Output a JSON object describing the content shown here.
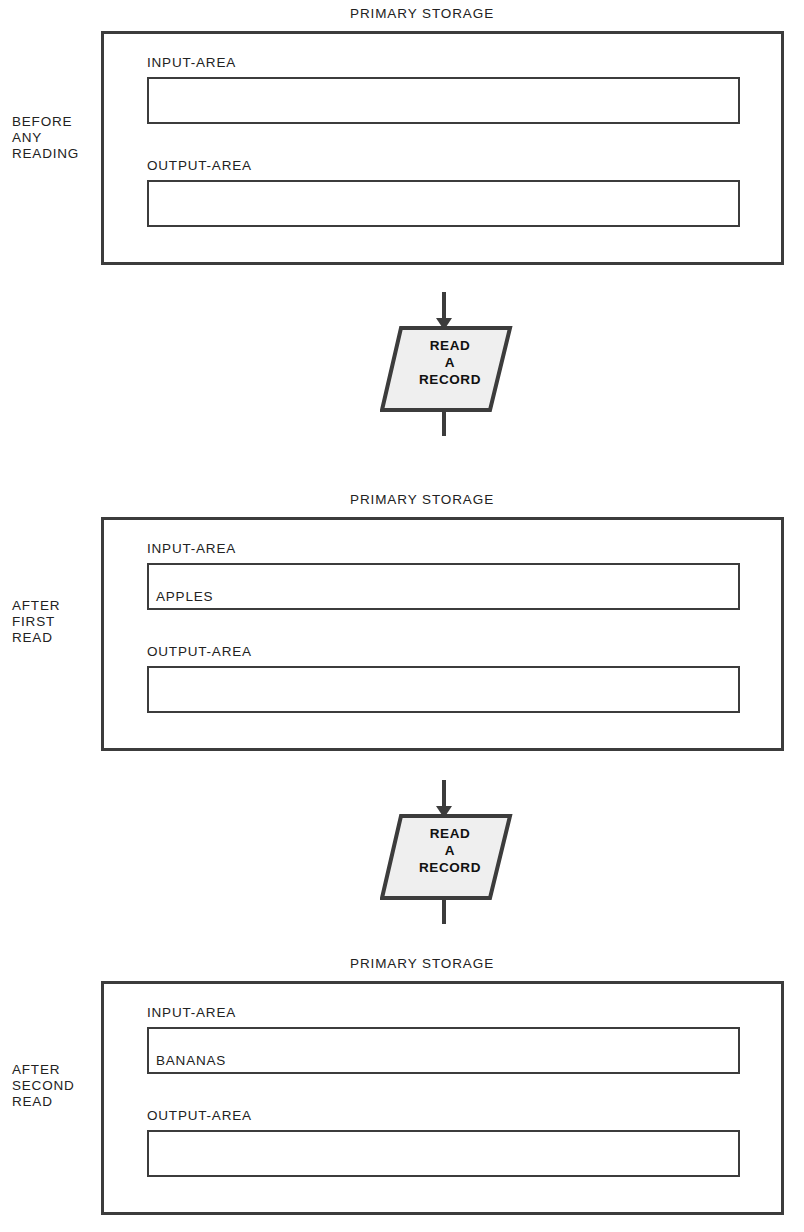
{
  "diagram": {
    "symbol_label_lines": [
      "READ",
      "A",
      "RECORD"
    ],
    "colors": {
      "line": "#3c3c3c",
      "symbol_fill": "#efefef",
      "text": "#222222",
      "background": "#ffffff"
    }
  },
  "panels": [
    {
      "stage_label": "BEFORE\nANY\nREADING",
      "stage_label_lines": [
        "BEFORE",
        "ANY",
        "READING"
      ],
      "title": "PRIMARY STORAGE",
      "input_label": "INPUT-AREA",
      "input_value": "",
      "output_label": "OUTPUT-AREA",
      "output_value": ""
    },
    {
      "stage_label": "AFTER\nFIRST\nREAD",
      "stage_label_lines": [
        "AFTER",
        "FIRST",
        "READ"
      ],
      "title": "PRIMARY STORAGE",
      "input_label": "INPUT-AREA",
      "input_value": "APPLES",
      "output_label": "OUTPUT-AREA",
      "output_value": ""
    },
    {
      "stage_label": "AFTER\nSECOND\nREAD",
      "stage_label_lines": [
        "AFTER",
        "SECOND",
        "READ"
      ],
      "title": "PRIMARY STORAGE",
      "input_label": "INPUT-AREA",
      "input_value": "BANANAS",
      "output_label": "OUTPUT-AREA",
      "output_value": ""
    }
  ],
  "operations": [
    {
      "label_lines": [
        "READ",
        "A",
        "RECORD"
      ],
      "name": "read-a-record"
    },
    {
      "label_lines": [
        "READ",
        "A",
        "RECORD"
      ],
      "name": "read-a-record"
    }
  ]
}
